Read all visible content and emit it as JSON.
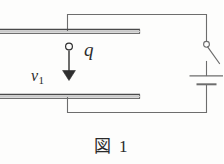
{
  "figure": {
    "caption": "図 1",
    "labels": {
      "charge": "q",
      "velocity": "v",
      "velocity_subscript": "1"
    },
    "colors": {
      "ink": "#3a3a3a",
      "plate": "#555555",
      "background": "#fdfdfc"
    },
    "components": {
      "top_plate": "capacitor-top-plate",
      "bottom_plate": "capacitor-bottom-plate",
      "switch": "open-switch",
      "battery": "dc-battery-cell",
      "charge": "point-charge",
      "arrow": "velocity-arrow-down",
      "wires": "connecting-wires"
    }
  }
}
